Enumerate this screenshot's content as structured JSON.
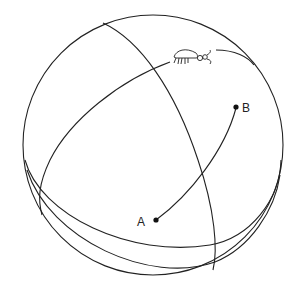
{
  "diagram": {
    "points": [
      {
        "label": "A"
      },
      {
        "label": "B"
      }
    ],
    "icons": [
      "bug-icon"
    ],
    "colors": {
      "line": "#222222",
      "background": "#ffffff"
    }
  }
}
